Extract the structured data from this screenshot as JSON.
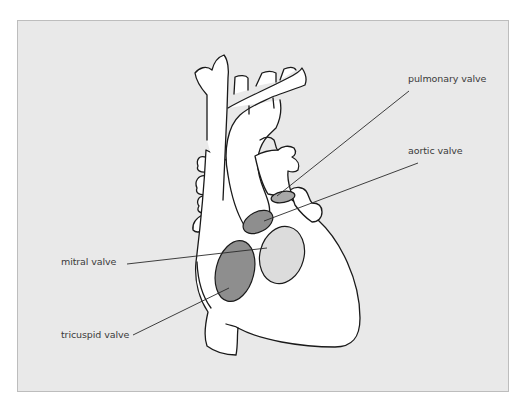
{
  "diagram": {
    "colors": {
      "background": "#e9e9e9",
      "frame_border": "#bdbdbd",
      "heart_fill": "#ffffff",
      "outline": "#1a1a1a",
      "valve_dark": "#8e8e8e",
      "valve_light": "#dcdcdc",
      "leader_line": "#2a2a2a",
      "label_text": "#3a3a3a"
    },
    "labels": {
      "pulmonary": "pulmonary valve",
      "aortic": "aortic valve",
      "mitral": "mitral valve",
      "tricuspid": "tricuspid valve"
    }
  }
}
